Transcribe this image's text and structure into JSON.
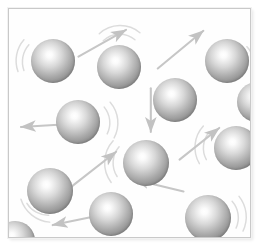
{
  "figure": {
    "panel": {
      "background_color": "#fefefe",
      "border_color": "#c9c9c9",
      "inset_px": 8,
      "width": 243,
      "height": 230
    },
    "colors": {
      "particle_rim": "#6f6f6f",
      "particle_highlight": "#ffffff",
      "arrow": "#c6c6c6",
      "motion_arc": "#dcdcdc",
      "background": "#ffffff"
    },
    "counts": {
      "particles": 12,
      "arrows": 8,
      "motion_arc_groups": 8
    },
    "particles": [
      {
        "id": "particle-1",
        "cx": 44,
        "cy": 52,
        "r": 22
      },
      {
        "id": "particle-2",
        "cx": 110,
        "cy": 58,
        "r": 22
      },
      {
        "id": "particle-3",
        "cx": 218,
        "cy": 52,
        "r": 22
      },
      {
        "id": "particle-4",
        "cx": 166,
        "cy": 91,
        "r": 22
      },
      {
        "id": "particle-5",
        "cx": 69,
        "cy": 113,
        "r": 22
      },
      {
        "id": "particle-6",
        "cx": 227,
        "cy": 139,
        "r": 22
      },
      {
        "id": "particle-7",
        "cx": 137,
        "cy": 154,
        "r": 23
      },
      {
        "id": "particle-8",
        "cx": 41,
        "cy": 182,
        "r": 23
      },
      {
        "id": "particle-9",
        "cx": 102,
        "cy": 205,
        "r": 22
      },
      {
        "id": "particle-10",
        "cx": 199,
        "cy": 209,
        "r": 23
      },
      {
        "id": "particle-11",
        "cx": 248,
        "cy": 93,
        "r": 20
      },
      {
        "id": "particle-12",
        "cx": 6,
        "cy": 232,
        "r": 20
      }
    ],
    "arrows": [
      {
        "id": "arrow-up-right-1",
        "x1": 70,
        "y1": 48,
        "x2": 118,
        "y2": 21,
        "direction": "up-right"
      },
      {
        "id": "arrow-up-right-2",
        "x1": 150,
        "y1": 60,
        "x2": 196,
        "y2": 22,
        "direction": "up-right"
      },
      {
        "id": "arrow-down-1",
        "x1": 143,
        "y1": 80,
        "x2": 143,
        "y2": 124,
        "direction": "down"
      },
      {
        "id": "arrow-left-1",
        "x1": 62,
        "y1": 116,
        "x2": 12,
        "y2": 119,
        "direction": "left"
      },
      {
        "id": "arrow-up-right-3",
        "x1": 62,
        "y1": 180,
        "x2": 108,
        "y2": 144,
        "direction": "up-right"
      },
      {
        "id": "arrow-up-right-4",
        "x1": 172,
        "y1": 152,
        "x2": 212,
        "y2": 120,
        "direction": "up-right"
      },
      {
        "id": "arrow-left-2",
        "x1": 176,
        "y1": 184,
        "x2": 126,
        "y2": 172,
        "direction": "left"
      },
      {
        "id": "arrow-left-3",
        "x1": 92,
        "y1": 208,
        "x2": 44,
        "y2": 218,
        "direction": "left"
      }
    ],
    "motion_arcs": [
      {
        "id": "arc-group-left-1",
        "cx": 44,
        "cy": 52,
        "side": "left"
      },
      {
        "id": "arc-group-top-1",
        "cx": 110,
        "cy": 58,
        "side": "top"
      },
      {
        "id": "arc-group-right-1",
        "cx": 218,
        "cy": 52,
        "side": "right"
      },
      {
        "id": "arc-group-right-2",
        "cx": 69,
        "cy": 113,
        "side": "right"
      },
      {
        "id": "arc-group-left-2",
        "cx": 227,
        "cy": 139,
        "side": "left"
      },
      {
        "id": "arc-group-left-3",
        "cx": 137,
        "cy": 154,
        "side": "left"
      },
      {
        "id": "arc-group-bottom-1",
        "cx": 41,
        "cy": 182,
        "side": "bottom-left"
      },
      {
        "id": "arc-group-right-3",
        "cx": 199,
        "cy": 209,
        "side": "right"
      }
    ]
  }
}
